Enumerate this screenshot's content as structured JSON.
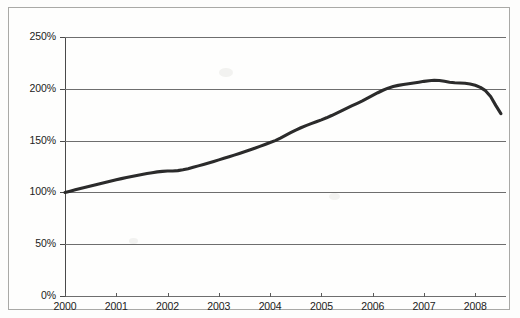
{
  "chart_data": {
    "type": "line",
    "title": "",
    "subtitle": "",
    "xlabel": "",
    "ylabel": "",
    "xlim": [
      2000,
      2008.6
    ],
    "ylim": [
      0,
      250
    ],
    "grid": true,
    "legend": false,
    "legend_position": "none",
    "line_color": "#2b2b2b",
    "grid_color": "#6e6e6e",
    "axis_color": "#4a4a4a",
    "background_color": "#fefefd",
    "y_ticks": [
      "0%",
      "50%",
      "100%",
      "150%",
      "200%",
      "250%"
    ],
    "y_tick_values": [
      0,
      50,
      100,
      150,
      200,
      250
    ],
    "x_ticks": [
      "2000",
      "2001",
      "2002",
      "2003",
      "2004",
      "2005",
      "2006",
      "2007",
      "2008"
    ],
    "x_tick_values": [
      2000,
      2001,
      2002,
      2003,
      2004,
      2005,
      2006,
      2007,
      2008
    ],
    "series": [
      {
        "name": "index",
        "x": [
          2000.0,
          2000.1,
          2000.2,
          2000.3,
          2000.4,
          2000.5,
          2000.6,
          2000.7,
          2000.8,
          2000.9,
          2001.0,
          2001.1,
          2001.2,
          2001.3,
          2001.4,
          2001.5,
          2001.6,
          2001.7,
          2001.8,
          2001.9,
          2002.0,
          2002.1,
          2002.2,
          2002.3,
          2002.4,
          2002.5,
          2002.6,
          2002.7,
          2002.8,
          2002.9,
          2003.0,
          2003.1,
          2003.2,
          2003.3,
          2003.4,
          2003.5,
          2003.6,
          2003.7,
          2003.8,
          2003.9,
          2004.0,
          2004.1,
          2004.2,
          2004.3,
          2004.4,
          2004.5,
          2004.6,
          2004.7,
          2004.8,
          2004.9,
          2005.0,
          2005.1,
          2005.2,
          2005.3,
          2005.4,
          2005.5,
          2005.6,
          2005.7,
          2005.8,
          2005.9,
          2006.0,
          2006.1,
          2006.2,
          2006.3,
          2006.4,
          2006.5,
          2006.6,
          2006.7,
          2006.8,
          2006.9,
          2007.0,
          2007.1,
          2007.2,
          2007.3,
          2007.4,
          2007.5,
          2007.6,
          2007.7,
          2007.8,
          2007.9,
          2008.0,
          2008.1,
          2008.2,
          2008.3,
          2008.4,
          2008.5
        ],
        "y": [
          100.0,
          101.2,
          102.5,
          103.8,
          105.0,
          106.2,
          107.4,
          108.6,
          109.8,
          111.0,
          112.2,
          113.3,
          114.4,
          115.4,
          116.4,
          117.3,
          118.2,
          119.0,
          119.8,
          120.3,
          120.6,
          120.7,
          121.0,
          121.8,
          122.9,
          124.2,
          125.6,
          127.0,
          128.4,
          129.9,
          131.4,
          132.9,
          134.4,
          136.0,
          137.6,
          139.2,
          140.9,
          142.6,
          144.4,
          146.2,
          148.1,
          150.0,
          152.4,
          155.0,
          157.6,
          160.1,
          162.4,
          164.5,
          166.4,
          168.2,
          170.0,
          172.0,
          174.2,
          176.6,
          179.0,
          181.4,
          183.7,
          186.0,
          188.4,
          191.0,
          193.6,
          196.2,
          198.6,
          200.6,
          202.2,
          203.3,
          204.2,
          204.9,
          205.6,
          206.4,
          207.2,
          207.8,
          208.2,
          208.0,
          207.2,
          206.4,
          205.9,
          205.6,
          205.3,
          204.6,
          203.4,
          201.4,
          198.2,
          192.6,
          184.0,
          176.0
        ],
        "start_value": 100,
        "peak_value": 208.2,
        "peak_x": 2007.2,
        "end_value": 172.0
      }
    ]
  }
}
